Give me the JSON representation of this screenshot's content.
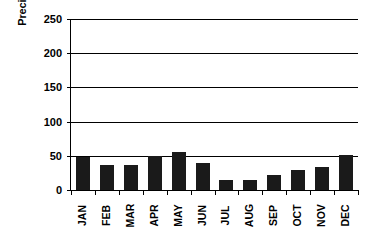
{
  "chart_data": {
    "type": "bar",
    "title": "",
    "xlabel": "",
    "ylabel": "Precipitation mm",
    "ylim": [
      0,
      250
    ],
    "ytick_step": 50,
    "yticks": [
      0,
      50,
      100,
      150,
      200,
      250
    ],
    "grid": true,
    "legend": false,
    "bar_color": "#1a1a1a",
    "axis_color": "#000000",
    "categories": [
      "JAN",
      "FEB",
      "MAR",
      "APR",
      "MAY",
      "JUN",
      "JUL",
      "AUG",
      "SEP",
      "OCT",
      "NOV",
      "DEC"
    ],
    "values": [
      48,
      36,
      36,
      50,
      55,
      39,
      14,
      14,
      22,
      29,
      34,
      51
    ]
  }
}
